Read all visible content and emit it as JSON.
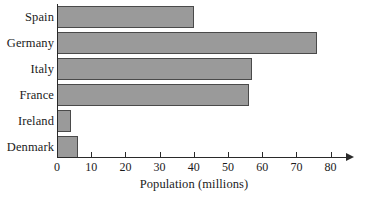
{
  "chart_data": {
    "type": "bar",
    "orientation": "horizontal",
    "title": "",
    "xlabel": "Population (millions)",
    "ylabel": "",
    "categories": [
      "Spain",
      "Germany",
      "Italy",
      "France",
      "Ireland",
      "Denmark"
    ],
    "values": [
      40,
      76,
      57,
      56,
      4,
      6
    ],
    "xlim": [
      0,
      80
    ],
    "xticks": [
      0,
      10,
      20,
      30,
      40,
      50,
      60,
      70,
      80
    ],
    "xtick_labels": [
      "0",
      "10",
      "20",
      "30",
      "40",
      "50",
      "60",
      "70",
      "80"
    ],
    "grid": false,
    "legend": null,
    "bar_fill_color": "#9a9a9a",
    "bar_edge_color": "#4a4a4a",
    "axis_color": "#2a2a2a",
    "text_color": "#1b1b1b",
    "background_color": "#ffffff",
    "x_axis_arrow": true
  }
}
